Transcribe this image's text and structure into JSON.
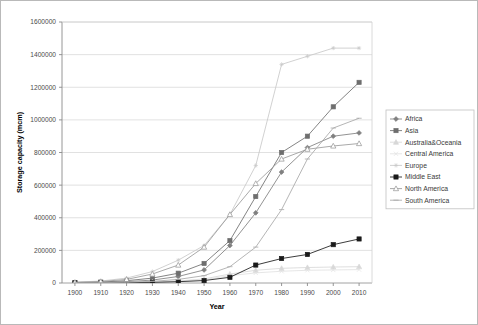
{
  "chart_data": {
    "type": "line",
    "title": "",
    "xlabel": "Year",
    "ylabel": "Storage capacity (mcm)",
    "x": [
      1900,
      1910,
      1920,
      1930,
      1940,
      1950,
      1960,
      1970,
      1980,
      1990,
      2000,
      2010
    ],
    "xlim": [
      1895,
      2015
    ],
    "ylim": [
      0,
      1600000
    ],
    "ytick_labels": [
      "0",
      "200000",
      "400000",
      "600000",
      "800000",
      "1000000",
      "1200000",
      "1400000",
      "1600000"
    ],
    "yticks": [
      0,
      200000,
      400000,
      600000,
      800000,
      1000000,
      1200000,
      1400000,
      1600000
    ],
    "xtick_labels": [
      "1900",
      "1910",
      "1920",
      "1930",
      "1940",
      "1950",
      "1960",
      "1970",
      "1980",
      "1990",
      "2000",
      "2010"
    ],
    "grid": "horizontal",
    "legend_position": "right",
    "series": [
      {
        "name": "Africa",
        "color": "#808080",
        "marker": "diamond",
        "values": [
          2000,
          4000,
          8000,
          18000,
          40000,
          80000,
          230000,
          430000,
          680000,
          830000,
          900000,
          920000
        ]
      },
      {
        "name": "Asia",
        "color": "#6e6e6e",
        "marker": "square",
        "values": [
          3000,
          6000,
          14000,
          30000,
          60000,
          120000,
          260000,
          530000,
          800000,
          900000,
          1080000,
          1230000
        ]
      },
      {
        "name": "Australia&Oceania",
        "color": "#d8d8d8",
        "marker": "triangle",
        "values": [
          500,
          1000,
          2500,
          6000,
          12000,
          25000,
          55000,
          78000,
          90000,
          95000,
          98000,
          100000
        ]
      },
      {
        "name": "Central America",
        "color": "#e2e2e2",
        "marker": "cross",
        "values": [
          300,
          800,
          2000,
          5000,
          10000,
          20000,
          45000,
          62000,
          72000,
          78000,
          80000,
          82000
        ]
      },
      {
        "name": "Europe",
        "color": "#c9c9c9",
        "marker": "star",
        "values": [
          5000,
          12000,
          30000,
          70000,
          140000,
          230000,
          420000,
          720000,
          1340000,
          1390000,
          1440000,
          1440000
        ]
      },
      {
        "name": "Middle East",
        "color": "#1a1a1a",
        "marker": "square-filled",
        "values": [
          500,
          1000,
          2000,
          4000,
          8000,
          15000,
          35000,
          110000,
          150000,
          175000,
          235000,
          270000
        ]
      },
      {
        "name": "North America",
        "color": "#9a9a9a",
        "marker": "triangle-open",
        "values": [
          4000,
          9000,
          22000,
          55000,
          110000,
          220000,
          420000,
          610000,
          760000,
          820000,
          840000,
          855000
        ]
      },
      {
        "name": "South America",
        "color": "#a8a8a8",
        "marker": "line",
        "values": [
          1000,
          2000,
          5000,
          10000,
          22000,
          45000,
          100000,
          220000,
          450000,
          760000,
          950000,
          1010000
        ]
      }
    ]
  }
}
